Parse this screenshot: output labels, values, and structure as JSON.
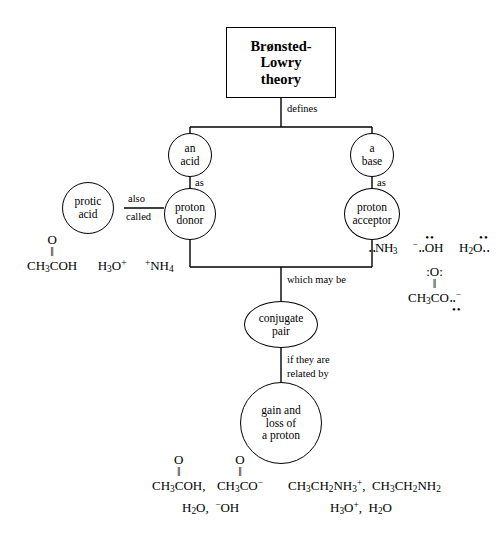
{
  "diagram": {
    "title_node": {
      "label": "Brønsted-\nLowry\ntheory"
    },
    "nodes": {
      "acid": "an\nacid",
      "base": "a\nbase",
      "proton_donor": "proton\ndonor",
      "proton_acceptor": "proton\nacceptor",
      "protic_acid": "protic\nacid",
      "conjugate_pair": "conjugate\npair",
      "gain_loss": "gain and\nloss of\na proton"
    },
    "edge_labels": {
      "defines": "defines",
      "as_left": "as",
      "as_right": "as",
      "also": "also",
      "called": "called",
      "which_may_be": "which may be",
      "if_they_are": "if they are",
      "related_by": "related by"
    }
  },
  "formulas": {
    "acid_examples": {
      "acetic_acid_chain": "CH3COH",
      "acetic_acid_carbonyl_o": "O",
      "hydronium": "H3O+",
      "ammonium": "+NH4"
    },
    "base_examples": {
      "ammonia": ":NH3",
      "hydroxide": "-:OH",
      "water": "H2O",
      "acetate_chain": "CH3CO:-",
      "acetate_carbonyl_o": ":O:"
    },
    "conjugate_examples": {
      "pair1_left": "CH3COH,",
      "pair1_right": "CH3CO-",
      "pair1_left_o": "O",
      "pair1_right_o": "O",
      "pair2": "H2O,  -OH",
      "pair3": "CH3CH2NH3+,  CH3CH2NH2",
      "pair4": "H3O+,  H2O"
    }
  },
  "colors": {
    "stroke": "#000000",
    "background": "#ffffff"
  }
}
